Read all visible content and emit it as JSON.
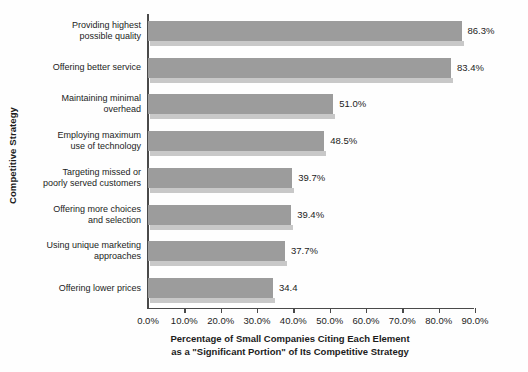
{
  "chart_data": {
    "type": "bar",
    "orientation": "horizontal",
    "title": "",
    "xlabel_line1": "Percentage of Small Companies Citing Each Element",
    "xlabel_line2": "as a \"Significant Portion\" of Its Competitive Strategy",
    "ylabel": "Competitive Strategy",
    "xlim": [
      0,
      90
    ],
    "grid": false,
    "legend": false,
    "categories": [
      "Providing highest possible quality",
      "Offering better service",
      "Maintaining minimal overhead",
      "Employing maximum use of technology",
      "Targeting missed or poorly served customers",
      "Offering more choices and selection",
      "Using unique marketing approaches",
      "Offering lower prices"
    ],
    "category_lines": [
      [
        "Providing highest",
        "possible quality"
      ],
      [
        "Offering better service"
      ],
      [
        "Maintaining minimal",
        "overhead"
      ],
      [
        "Employing maximum",
        "use of technology"
      ],
      [
        "Targeting missed or",
        "poorly served customers"
      ],
      [
        "Offering more choices",
        "and selection"
      ],
      [
        "Using unique marketing",
        "approaches"
      ],
      [
        "Offering lower prices"
      ]
    ],
    "values": [
      86.3,
      83.4,
      51.0,
      48.5,
      39.7,
      39.4,
      37.7,
      34.4
    ],
    "data_labels": [
      "86.3%",
      "83.4%",
      "51.0%",
      "48.5%",
      "39.7%",
      "39.4%",
      "37.7%",
      "34.4"
    ],
    "xticks": [
      0,
      10,
      20,
      30,
      40,
      50,
      60,
      70,
      80,
      90
    ],
    "xtick_labels": [
      "0.0%",
      "10.0%",
      "20.0%",
      "30.0%",
      "40.0%",
      "50.0%",
      "60.0%",
      "70.0%",
      "80.0%",
      "90.0%"
    ],
    "colors": {
      "bar": "#9c9c9c",
      "bar_shadow": "#c8c8c8",
      "axis": "#4a4a4a",
      "text": "#1c1c1c",
      "background": "#fefefe"
    }
  }
}
